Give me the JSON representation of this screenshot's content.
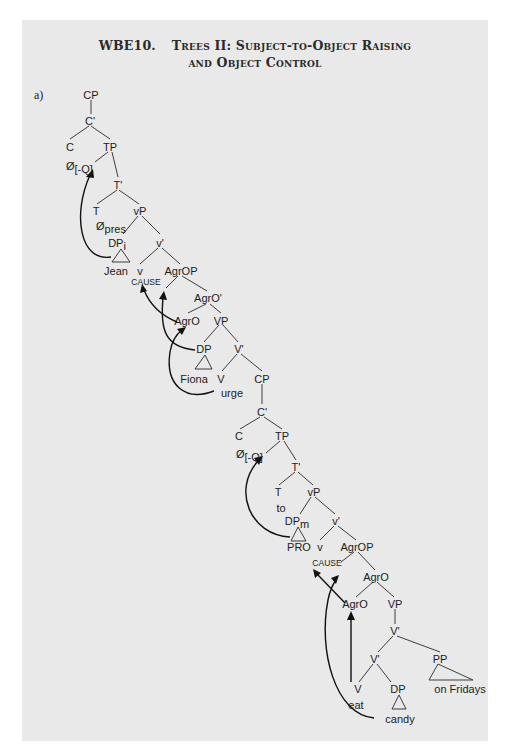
{
  "title": {
    "code": "WBE10.",
    "line1": "Trees II: Subject-to-Object Raising",
    "line2": "and Object Control"
  },
  "example_label": "a)",
  "tree": {
    "matrix": {
      "cp": "CP",
      "c_bar": "C'",
      "c": "C",
      "c_null": "Ø",
      "c_feature": "[-Q]",
      "tp": "TP",
      "t_bar": "T'",
      "t": "T",
      "t_null": "Ø",
      "t_feature": "pres",
      "vp_little": "vP",
      "dp_subject": "DP",
      "dp_subject_index": "i",
      "subject": "Jean",
      "v_bar": "v'",
      "v": "v",
      "v_cause": "CAUSE",
      "agrop": "AgrOP",
      "agro_bar": "AgrO'",
      "agro": "AgrO",
      "vp": "VP",
      "dp_object": "DP",
      "object": "Fiona",
      "v_bar_big": "V'",
      "verb_label": "V",
      "verb": "urge"
    },
    "embedded": {
      "cp": "CP",
      "c_bar": "C'",
      "c": "C",
      "c_null": "Ø",
      "c_feature": "[-Q]",
      "tp": "TP",
      "t_bar": "T'",
      "t": "T",
      "t_word": "to",
      "vp_little": "vP",
      "dp_subject": "DP",
      "dp_subject_index": "m",
      "subject": "PRO",
      "v_bar": "v'",
      "v": "v",
      "v_cause": "CAUSE",
      "agrop": "AgrOP",
      "agro_bar": "AgrO",
      "agro": "AgrO",
      "vp": "VP",
      "v_bar_upper": "V'",
      "v_bar_lower": "V'",
      "pp": "PP",
      "pp_text": "on Fridays",
      "verb_label": "V",
      "verb": "eat",
      "dp_object": "DP",
      "object": "candy"
    }
  }
}
